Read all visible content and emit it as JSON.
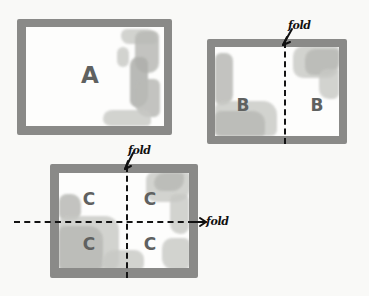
{
  "diagram": {
    "background_color": "#f9f9f7",
    "frame_color": "#8a8a88",
    "letter_color": "#5f6160",
    "fold_line_color": "#141414",
    "smudge_color": "#b9bab6"
  },
  "panels": [
    {
      "id": "panel-a",
      "letters": [
        "A"
      ],
      "folds": []
    },
    {
      "id": "panel-b",
      "letters": [
        "B",
        "B"
      ],
      "folds": [
        "fold"
      ]
    },
    {
      "id": "panel-c",
      "letters": [
        "C",
        "C",
        "C",
        "C"
      ],
      "folds": [
        "fold",
        "fold"
      ]
    }
  ],
  "labels": {
    "letter_a": "A",
    "letter_b_left": "B",
    "letter_b_right": "B",
    "letter_c_tl": "C",
    "letter_c_tr": "C",
    "letter_c_bl": "C",
    "letter_c_br": "C",
    "fold_b_top": "fold",
    "fold_c_top": "fold",
    "fold_c_right": "fold"
  }
}
